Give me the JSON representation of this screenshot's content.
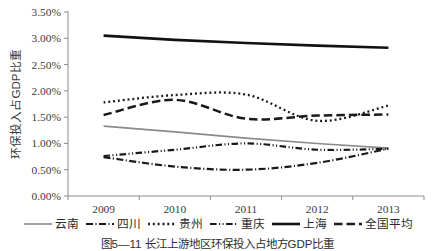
{
  "figure": {
    "caption": "图5—11 长江上游地区环保投入占地方GDP比重"
  },
  "chart_data": {
    "type": "line",
    "title": "",
    "xlabel": "",
    "ylabel": "环保投入占GDP比重",
    "categories": [
      "2009",
      "2010",
      "2011",
      "2012",
      "2013"
    ],
    "ylim": [
      0,
      3.5
    ],
    "yticks": [
      "0.00%",
      "0.50%",
      "1.00%",
      "1.50%",
      "2.00%",
      "2.50%",
      "3.00%",
      "3.50%"
    ],
    "ytick_values": [
      0.0,
      0.5,
      1.0,
      1.5,
      2.0,
      2.5,
      3.0,
      3.5
    ],
    "unit": "%",
    "grid": false,
    "legend_position": "bottom",
    "series": [
      {
        "name": "云南",
        "key": "yunnan",
        "values": [
          1.33,
          1.22,
          1.1,
          1.0,
          0.91
        ],
        "color": "#8a8a8a",
        "dash": "none",
        "width": 1.6
      },
      {
        "name": "四川",
        "key": "sichuan",
        "values": [
          0.74,
          0.56,
          0.5,
          0.63,
          0.9
        ],
        "color": "#1a1a1a",
        "dash": "dash-dot",
        "width": 2.2
      },
      {
        "name": "贵州",
        "key": "guizhou",
        "values": [
          1.78,
          1.92,
          1.93,
          1.43,
          1.72
        ],
        "color": "#1a1a1a",
        "dash": "dotted",
        "width": 2.3
      },
      {
        "name": "重庆",
        "key": "chongqing",
        "values": [
          0.76,
          0.88,
          1.0,
          0.88,
          0.9
        ],
        "color": "#1a1a1a",
        "dash": "dash-dot-dot",
        "width": 2.2
      },
      {
        "name": "上海",
        "key": "shanghai",
        "values": [
          3.05,
          2.97,
          2.91,
          2.86,
          2.82
        ],
        "color": "#121212",
        "dash": "solid",
        "width": 2.6
      },
      {
        "name": "全国平均",
        "key": "national-average",
        "values": [
          1.54,
          1.83,
          1.47,
          1.53,
          1.55
        ],
        "color": "#1a1a1a",
        "dash": "long-dash",
        "width": 2.5
      }
    ]
  }
}
